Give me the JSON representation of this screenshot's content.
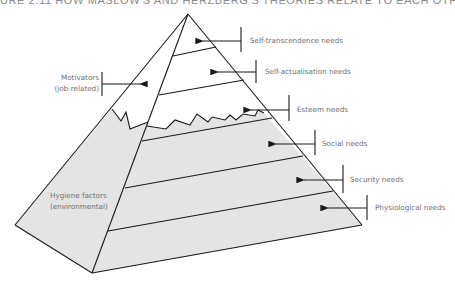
{
  "header": {
    "title": "URE 2.11  HOW MASLOW'S AND HERZBERG'S THEORIES RELATE TO EACH OTHE"
  },
  "diagram": {
    "type": "pyramid",
    "colors": {
      "shaded": "#e4e4e4",
      "line": "#1a1a1a",
      "text": "#707070",
      "background": "#ffffff"
    },
    "left_labels": {
      "motivators": {
        "line1": "Motivators",
        "line2": "(job-related)"
      },
      "hygiene": {
        "line1": "Hygiene factors",
        "line2": "(environmental)"
      }
    },
    "levels": [
      {
        "label": "Self-transcendence needs"
      },
      {
        "label": "Self-actualisation needs"
      },
      {
        "label": "Esteem needs"
      },
      {
        "label": "Social needs"
      },
      {
        "label": "Security needs"
      },
      {
        "label": "Physiological needs"
      }
    ]
  }
}
